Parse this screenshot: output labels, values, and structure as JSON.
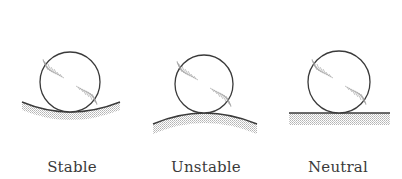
{
  "figure": {
    "colors": {
      "stroke": "#3a3a3a",
      "hatch": "#9a9a9a",
      "shade": "#c8c8c8",
      "background": "#ffffff"
    },
    "panels": [
      {
        "label": "Stable",
        "surface": "concave",
        "ball": {
          "cx": 70,
          "cy": 82,
          "r": 30
        },
        "label_x": 72
      },
      {
        "label": "Unstable",
        "surface": "convex",
        "ball": {
          "cx": 204,
          "cy": 84,
          "r": 29
        },
        "label_x": 206
      },
      {
        "label": "Neutral",
        "surface": "flat",
        "ball": {
          "cx": 339,
          "cy": 82,
          "r": 31
        },
        "label_x": 338
      }
    ]
  }
}
